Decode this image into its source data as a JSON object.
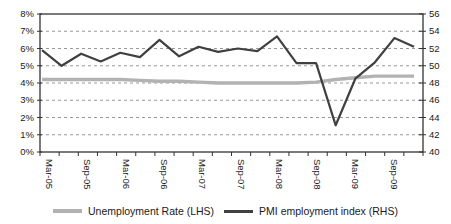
{
  "chart_data": {
    "type": "line",
    "categories": [
      "Mar-05",
      "Jun-05",
      "Sep-05",
      "Dec-05",
      "Mar-06",
      "Jun-06",
      "Sep-06",
      "Dec-06",
      "Mar-07",
      "Jun-07",
      "Sep-07",
      "Dec-07",
      "Mar-08",
      "Jun-08",
      "Sep-08",
      "Dec-08",
      "Mar-09",
      "Jun-09",
      "Sep-09",
      "Dec-09"
    ],
    "x_axis": {
      "visible_tick_labels": [
        "Mar-05",
        "Sep-05",
        "Mar-06",
        "Sep-06",
        "Mar-07",
        "Sep-07",
        "Mar-08",
        "Sep-08",
        "Mar-09",
        "Sep-09"
      ],
      "label_rotation_deg": 90
    },
    "left_axis": {
      "min": 0,
      "max": 8,
      "step": 1,
      "tick_labels": [
        "8%",
        "7%",
        "6%",
        "5%",
        "4%",
        "3%",
        "2%",
        "1%",
        "0%"
      ]
    },
    "right_axis": {
      "min": 40,
      "max": 56,
      "step": 2,
      "tick_labels": [
        "56",
        "54",
        "52",
        "50",
        "48",
        "46",
        "44",
        "42",
        "40"
      ]
    },
    "grid": {
      "horizontal": true,
      "style": "dashed",
      "color": "#999999"
    },
    "frame_color": "#333333",
    "series": [
      {
        "name": "Unemployment Rate (LHS)",
        "axis": "left",
        "color": "#b2b2b2",
        "stroke_width": 3.4,
        "values": [
          4.2,
          4.2,
          4.2,
          4.2,
          4.2,
          4.15,
          4.1,
          4.1,
          4.05,
          4.0,
          4.0,
          4.0,
          4.0,
          4.0,
          4.05,
          4.2,
          4.3,
          4.4,
          4.4,
          4.4
        ]
      },
      {
        "name": "PMI employment index (RHS)",
        "axis": "right",
        "color": "#404040",
        "stroke_width": 2.2,
        "values": [
          51.8,
          50.0,
          51.4,
          50.5,
          51.5,
          51.0,
          53.0,
          51.1,
          52.2,
          51.6,
          52.0,
          51.7,
          53.4,
          50.3,
          50.3,
          43.1,
          48.5,
          50.4,
          53.2,
          52.2
        ]
      }
    ],
    "legend_position": "bottom"
  },
  "legend": {
    "unemployment_label": "Unemployment Rate (LHS)",
    "pmi_label": "PMI employment index (RHS)"
  }
}
